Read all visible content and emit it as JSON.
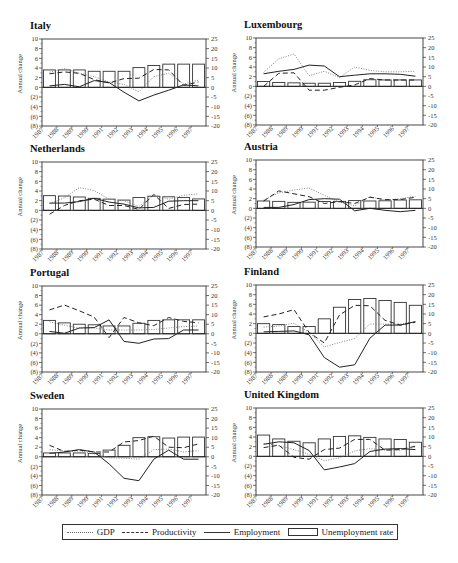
{
  "legend": {
    "gdp": "GDP",
    "productivity": "Productivity",
    "employment": "Employment",
    "unemployment": "Unemployment rate"
  },
  "axis": {
    "left_label": "Annual change",
    "left_ticks": [
      "10",
      "8",
      "6",
      "4",
      "2",
      "0",
      "(2)",
      "(4)",
      "(6)",
      "(8)"
    ],
    "right_ticks": [
      "25",
      "20",
      "15",
      "10",
      "5",
      "0",
      "-5",
      "-10",
      "-15",
      "-20"
    ]
  },
  "chart_data": [
    {
      "type": "bar+line",
      "title": "Italy",
      "categories": [
        "1987",
        "1988",
        "1989",
        "1990",
        "1991",
        "1992",
        "1993",
        "1994",
        "1995",
        "1996",
        "1997"
      ],
      "ylabel": "Annual change",
      "ylim": [
        -8,
        10
      ],
      "ylim_right": [
        -20,
        25
      ],
      "series": [
        {
          "name": "GDP",
          "axis": "left",
          "values": [
            3.1,
            3.9,
            2.9,
            2.2,
            1.1,
            0.6,
            -0.9,
            2.2,
            2.9,
            0.7,
            1.5
          ]
        },
        {
          "name": "Productivity",
          "axis": "left",
          "values": [
            2.8,
            3.2,
            2.9,
            1.6,
            0.9,
            1.8,
            1.9,
            3.7,
            3.6,
            0.4,
            1.1
          ]
        },
        {
          "name": "Employment",
          "axis": "left",
          "values": [
            0.3,
            0.6,
            0.1,
            1.4,
            1.0,
            -1.0,
            -2.8,
            -1.6,
            -0.6,
            0.5,
            0.3
          ]
        },
        {
          "name": "Unemployment rate",
          "axis": "right",
          "values": [
            9.0,
            9.0,
            9.0,
            8.3,
            8.3,
            8.3,
            10.2,
            11.3,
            12.0,
            12.0,
            12.0
          ]
        }
      ]
    },
    {
      "type": "bar+line",
      "title": "Luxembourg",
      "categories": [
        "1987",
        "1988",
        "1989",
        "1990",
        "1991",
        "1992",
        "1993",
        "1994",
        "1995",
        "1996",
        "1997"
      ],
      "ylabel": "Annual change",
      "ylim": [
        -8,
        10
      ],
      "ylim_right": [
        -20,
        25
      ],
      "series": [
        {
          "name": "GDP",
          "axis": "left",
          "values": [
            2.9,
            5.7,
            6.7,
            2.2,
            3.1,
            1.8,
            4.0,
            3.3,
            3.0,
            3.0,
            3.1
          ]
        },
        {
          "name": "Productivity",
          "axis": "left",
          "values": [
            0.0,
            2.7,
            2.8,
            -0.8,
            -0.8,
            -0.2,
            0.3,
            1.6,
            1.3,
            1.3,
            1.3
          ]
        },
        {
          "name": "Employment",
          "axis": "left",
          "values": [
            2.6,
            3.1,
            3.5,
            4.4,
            4.2,
            2.0,
            2.3,
            2.6,
            2.6,
            2.5,
            2.1
          ]
        },
        {
          "name": "Unemployment rate",
          "axis": "right",
          "values": [
            2.5,
            2.0,
            1.8,
            1.6,
            1.6,
            2.0,
            2.6,
            3.4,
            3.3,
            3.3,
            3.3
          ]
        }
      ]
    },
    {
      "type": "bar+line",
      "title": "Netherlands",
      "categories": [
        "1987",
        "1988",
        "1989",
        "1990",
        "1991",
        "1992",
        "1993",
        "1994",
        "1995",
        "1996",
        "1997"
      ],
      "ylabel": "Annual change",
      "ylim": [
        -8,
        10
      ],
      "ylim_right": [
        -20,
        25
      ],
      "series": [
        {
          "name": "GDP",
          "axis": "left",
          "values": [
            1.4,
            2.6,
            4.7,
            4.1,
            2.3,
            2.0,
            0.8,
            3.2,
            2.3,
            3.1,
            3.4
          ]
        },
        {
          "name": "Productivity",
          "axis": "left",
          "values": [
            -0.8,
            1.0,
            2.0,
            2.3,
            1.0,
            1.0,
            0.2,
            3.3,
            0.4,
            1.2,
            1.3
          ]
        },
        {
          "name": "Employment",
          "axis": "left",
          "values": [
            1.5,
            1.5,
            1.8,
            2.5,
            1.7,
            1.3,
            0.5,
            0.6,
            1.9,
            2.0,
            2.0
          ]
        },
        {
          "name": "Unemployment rate",
          "axis": "right",
          "values": [
            7.6,
            7.4,
            6.9,
            6.2,
            5.8,
            5.3,
            6.6,
            7.3,
            7.0,
            6.6,
            5.9
          ]
        }
      ]
    },
    {
      "type": "bar+line",
      "title": "Austria",
      "categories": [
        "1987",
        "1988",
        "1989",
        "1990",
        "1991",
        "1992",
        "1993",
        "1994",
        "1995",
        "1996",
        "1997"
      ],
      "ylabel": "Annual change",
      "ylim": [
        -8,
        10
      ],
      "ylim_right": [
        -20,
        25
      ],
      "series": [
        {
          "name": "GDP",
          "axis": "left",
          "values": [
            1.7,
            3.2,
            3.8,
            4.2,
            2.7,
            1.3,
            0.5,
            2.4,
            1.7,
            2.0,
            2.5
          ]
        },
        {
          "name": "Productivity",
          "axis": "left",
          "values": [
            1.5,
            3.6,
            3.0,
            2.4,
            1.0,
            1.4,
            1.0,
            2.3,
            1.8,
            1.8,
            2.3
          ]
        },
        {
          "name": "Employment",
          "axis": "left",
          "values": [
            0.2,
            0.2,
            0.8,
            1.8,
            2.0,
            1.9,
            -0.5,
            0.0,
            -0.4,
            -0.7,
            -0.4
          ]
        },
        {
          "name": "Unemployment rate",
          "axis": "right",
          "values": [
            3.8,
            3.6,
            3.1,
            3.2,
            3.5,
            3.6,
            4.0,
            3.8,
            3.9,
            4.3,
            4.4
          ]
        }
      ]
    },
    {
      "type": "bar+line",
      "title": "Portugal",
      "categories": [
        "1987",
        "1988",
        "1989",
        "1990",
        "1991",
        "1992",
        "1993",
        "1994",
        "1995",
        "1996",
        "1997"
      ],
      "ylabel": "Annual change",
      "ylim": [
        -8,
        10
      ],
      "ylim_right": [
        -20,
        25
      ],
      "series": [
        {
          "name": "GDP",
          "axis": "left",
          "values": [
            2.5,
            1.8,
            1.2,
            1.2,
            0.8,
            0.8,
            0.8,
            0.9,
            1.2,
            1.5,
            1.6
          ]
        },
        {
          "name": "Productivity",
          "axis": "left",
          "values": [
            5.0,
            6.0,
            4.8,
            3.5,
            -0.8,
            3.4,
            2.3,
            1.7,
            3.4,
            2.6,
            2.3
          ]
        },
        {
          "name": "Employment",
          "axis": "left",
          "values": [
            0.5,
            0.1,
            1.2,
            1.3,
            2.9,
            -1.6,
            -2.0,
            -1.1,
            -1.0,
            0.8,
            0.8
          ]
        },
        {
          "name": "Unemployment rate",
          "axis": "right",
          "values": [
            7.0,
            5.7,
            5.0,
            4.7,
            4.1,
            4.1,
            5.5,
            7.0,
            7.3,
            7.3,
            7.3
          ]
        }
      ]
    },
    {
      "type": "bar+line",
      "title": "Finland",
      "categories": [
        "1987",
        "1988",
        "1989",
        "1990",
        "1991",
        "1992",
        "1993",
        "1994",
        "1995",
        "1996",
        "1997"
      ],
      "ylabel": "Annual change",
      "ylim": [
        -8,
        10
      ],
      "ylim_right": [
        -20,
        25
      ],
      "series": [
        {
          "name": "GDP",
          "axis": "left",
          "values": [
            1.3,
            1.5,
            2.1,
            0.2,
            -2.8,
            -1.9,
            -1.1,
            1.9,
            1.9,
            1.9,
            2.4
          ]
        },
        {
          "name": "Productivity",
          "axis": "left",
          "values": [
            3.4,
            4.0,
            4.9,
            0.2,
            -2.0,
            3.8,
            5.8,
            5.7,
            2.7,
            1.7,
            2.3
          ]
        },
        {
          "name": "Employment",
          "axis": "left",
          "values": [
            0.3,
            0.4,
            0.5,
            -0.3,
            -5.0,
            -7.0,
            -6.5,
            -1.0,
            1.7,
            1.7,
            2.4
          ]
        },
        {
          "name": "Unemployment rate",
          "axis": "right",
          "values": [
            5.0,
            4.5,
            3.5,
            3.5,
            7.5,
            13.5,
            17.5,
            18.0,
            17.0,
            16.0,
            14.5
          ]
        }
      ]
    },
    {
      "type": "bar+line",
      "title": "Sweden",
      "categories": [
        "1987",
        "1988",
        "1989",
        "1990",
        "1991",
        "1992",
        "1993",
        "1994",
        "1995",
        "1996",
        "1997"
      ],
      "ylabel": "Annual change",
      "ylim": [
        -8,
        10
      ],
      "ylim_right": [
        -20,
        25
      ],
      "series": [
        {
          "name": "GDP",
          "axis": "left",
          "values": [
            1.5,
            1.2,
            1.2,
            0.6,
            -0.2,
            -0.3,
            -0.5,
            1.5,
            1.6,
            1.0,
            1.3
          ]
        },
        {
          "name": "Productivity",
          "axis": "left",
          "values": [
            2.4,
            1.1,
            1.4,
            1.0,
            1.0,
            3.1,
            3.4,
            4.3,
            2.0,
            1.9,
            2.7
          ]
        },
        {
          "name": "Employment",
          "axis": "left",
          "values": [
            0.7,
            1.0,
            1.5,
            1.0,
            -1.5,
            -4.5,
            -5.0,
            -0.5,
            1.4,
            -0.5,
            -0.5
          ]
        },
        {
          "name": "Unemployment rate",
          "axis": "right",
          "values": [
            2.0,
            2.0,
            2.0,
            1.7,
            3.5,
            6.0,
            10.0,
            10.5,
            9.8,
            10.3,
            10.3
          ]
        }
      ]
    },
    {
      "type": "bar+line",
      "title": "United Kingdom",
      "categories": [
        "1987",
        "1988",
        "1989",
        "1990",
        "1991",
        "1992",
        "1993",
        "1994",
        "1995",
        "1996",
        "1997"
      ],
      "ylabel": "Annual change",
      "ylim": [
        -8,
        10
      ],
      "ylim_right": [
        -20,
        25
      ],
      "series": [
        {
          "name": "GDP",
          "axis": "left",
          "values": [
            2.7,
            2.2,
            1.4,
            0.4,
            -0.9,
            -0.3,
            1.1,
            1.6,
            1.3,
            1.3,
            1.9
          ]
        },
        {
          "name": "Productivity",
          "axis": "left",
          "values": [
            1.8,
            2.3,
            -0.2,
            -0.6,
            1.4,
            1.7,
            3.5,
            3.5,
            1.3,
            1.4,
            2.1
          ]
        },
        {
          "name": "Employment",
          "axis": "left",
          "values": [
            2.5,
            3.0,
            2.8,
            1.2,
            -2.8,
            -2.2,
            -1.5,
            1.0,
            1.5,
            1.6,
            1.4
          ]
        },
        {
          "name": "Unemployment rate",
          "axis": "right",
          "values": [
            11.0,
            9.0,
            7.8,
            7.0,
            9.0,
            10.3,
            10.6,
            9.8,
            9.0,
            8.7,
            7.3
          ]
        }
      ]
    }
  ]
}
